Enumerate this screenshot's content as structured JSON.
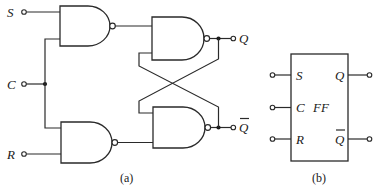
{
  "figure_a": {
    "caption": "(a)",
    "inputs": [
      {
        "id": "S",
        "label": "S"
      },
      {
        "id": "C",
        "label": "C"
      },
      {
        "id": "R",
        "label": "R"
      }
    ],
    "outputs": [
      {
        "id": "Q",
        "label": "Q"
      },
      {
        "id": "Qbar",
        "label": "Q",
        "overline": true
      }
    ],
    "gates": [
      {
        "id": "nand-s",
        "type": "NAND",
        "inputs": [
          "S",
          "C"
        ]
      },
      {
        "id": "nand-r",
        "type": "NAND",
        "inputs": [
          "C",
          "R"
        ]
      },
      {
        "id": "nand-q",
        "type": "NAND",
        "inputs": [
          "nand-s",
          "Qbar"
        ]
      },
      {
        "id": "nand-qbar",
        "type": "NAND",
        "inputs": [
          "Q",
          "nand-r"
        ]
      }
    ]
  },
  "figure_b": {
    "caption": "(b)",
    "block_label": "FF",
    "left_pins": [
      {
        "label": "S"
      },
      {
        "label": "C"
      },
      {
        "label": "R"
      }
    ],
    "right_pins": [
      {
        "label": "Q"
      },
      {
        "label": "Q",
        "overline": true
      }
    ]
  }
}
